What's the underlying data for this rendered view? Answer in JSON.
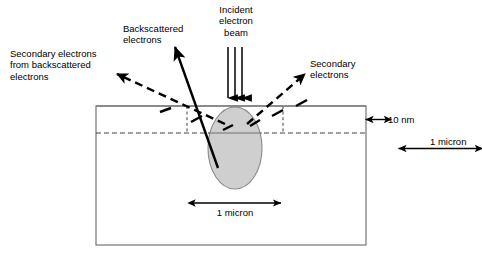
{
  "diagram": {
    "background_color": "#ffffff",
    "stroke_color": "#000000",
    "sample_outline_color": "#808080",
    "interaction_volume_fill": "#cccccc",
    "interaction_volume_stroke": "#808080"
  },
  "labels": {
    "incident_beam": "Incident\nelectron\nbeam",
    "backscattered": "Backscattered\nelectrons",
    "secondary_from_backscattered": "Secondary electrons\nfrom backscattered\nelectrons",
    "secondary": "Secondary\nelectrons"
  },
  "dimensions": {
    "escape_depth": "10 nm",
    "sample_depth": "1 micron",
    "volume_width": "1 micron"
  },
  "icons": {
    "incident_beam_arrows": "down-arrow-icon",
    "backscattered_arrow": "up-left-solid-arrow-icon",
    "secondary_arrow_left": "up-left-dashed-arrow-icon",
    "secondary_arrow_right": "up-right-dashed-arrow-icon",
    "escape_depth_arrow": "double-headed-vertical-arrow-icon",
    "sample_depth_arrow": "double-headed-vertical-arrow-icon",
    "volume_width_arrow": "double-headed-horizontal-arrow-icon"
  },
  "geometry": {
    "sample_rect": {
      "x": 96,
      "y": 106,
      "width": 270,
      "height": 139
    },
    "interaction_volume": {
      "cx": 235,
      "cy": 148,
      "rx": 27,
      "ry": 41
    },
    "escape_depth_line_y": 133,
    "beam_impact_x": 235,
    "surface_y": 106
  }
}
